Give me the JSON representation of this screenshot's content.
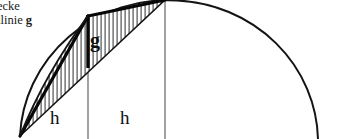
{
  "figure": {
    "caption": {
      "line1": "eiecke",
      "line2_prefix": "ndlinie ",
      "line2_term": "g"
    },
    "labels": {
      "baseline": "g",
      "height_left": "h",
      "height_right": "h"
    },
    "colors": {
      "stroke": "#111111",
      "hatch": "#555555",
      "grid": "#6b6b6b",
      "background": "#ffffff"
    },
    "geometry": {
      "arc": {
        "center_x": 168,
        "center_y": 142,
        "radius": 142,
        "start_x": 20,
        "start_y": 136,
        "end_x": 322,
        "end_y": 139
      },
      "vertex_x": 20,
      "vertex_y": 136,
      "apex_x": 165,
      "apex_y": 0,
      "mid_x": 88,
      "mid_y": 16,
      "baseline_bottom_y": 68,
      "gridline_left_x": 88,
      "gridline_right_x": 165,
      "hatch_spacing": 4
    }
  }
}
